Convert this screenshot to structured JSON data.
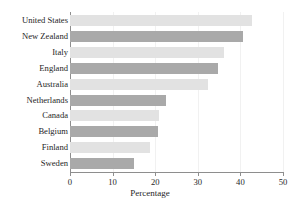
{
  "chart_data": {
    "type": "bar",
    "orientation": "horizontal",
    "title": "Their Own Area After Dark",
    "xlabel": "Percentage",
    "ylabel": "",
    "categories": [
      "United States",
      "New Zealand",
      "Italy",
      "England",
      "Australia",
      "Netherlands",
      "Canada",
      "Belgium",
      "Finland",
      "Sweden"
    ],
    "values": [
      42.7,
      40.6,
      36.2,
      34.8,
      32.4,
      22.5,
      21.0,
      20.7,
      18.8,
      15.0
    ],
    "xlim": [
      0,
      50
    ],
    "xticks": [
      0,
      10,
      20,
      30,
      40,
      50
    ],
    "xtick_labels": [
      "0",
      "10",
      "20",
      "30",
      "40",
      "50"
    ],
    "grid": true,
    "legend": false,
    "bar_colors": [
      "#e2e2e2",
      "#a9a9a9"
    ],
    "axis_color": "#8e8e8e",
    "grid_color": "#f1f1f1",
    "background": "#ffffff"
  }
}
